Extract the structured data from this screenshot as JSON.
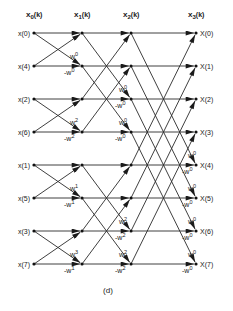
{
  "figure_label": "(d)",
  "columns": [
    {
      "label": "x",
      "sub": "0",
      "arg": "(k)",
      "x": 34
    },
    {
      "label": "x",
      "sub": "1",
      "arg": "(k)",
      "x": 82
    },
    {
      "label": "x",
      "sub": "2",
      "arg": "(k)",
      "x": 131
    },
    {
      "label": "x",
      "sub": "3",
      "arg": "(k)",
      "x": 196
    }
  ],
  "rows_y": [
    33,
    66,
    99,
    132,
    165,
    198,
    231,
    264
  ],
  "inputs": [
    "x(0)",
    "x(4)",
    "x(2)",
    "x(6)",
    "x(1)",
    "x(5)",
    "x(3)",
    "x(7)"
  ],
  "outputs": [
    "X(0)",
    "X(1)",
    "X(2)",
    "X(3)",
    "X(4)",
    "X(5)",
    "X(6)",
    "X(7)"
  ],
  "stages": [
    {
      "from_col": 0,
      "to_col": 1,
      "span": 1,
      "weights": [
        {
          "pair": [
            0,
            1
          ],
          "cross": "w0",
          "bottom": "-w0"
        },
        {
          "pair": [
            2,
            3
          ],
          "cross": "w2",
          "bottom": "-w2"
        },
        {
          "pair": [
            4,
            5
          ],
          "cross": "w1",
          "bottom": "-w1"
        },
        {
          "pair": [
            6,
            7
          ],
          "cross": "w3",
          "bottom": "-w1"
        }
      ]
    },
    {
      "from_col": 1,
      "to_col": 2,
      "span": 2,
      "weights": [
        {
          "row": 2,
          "cross": "w0",
          "bottom": "-w0"
        },
        {
          "row": 3,
          "cross": "w0",
          "bottom": "-w0"
        },
        {
          "row": 6,
          "cross": "w2",
          "bottom": "-w2"
        },
        {
          "row": 7,
          "cross": "w2",
          "bottom": "-w2"
        }
      ]
    },
    {
      "from_col": 2,
      "to_col": 3,
      "span": 4,
      "weights": [
        {
          "row": 4,
          "cross": "w0",
          "bottom": "-w0"
        },
        {
          "row": 5,
          "cross": "w0",
          "bottom": "-w0"
        },
        {
          "row": 6,
          "cross": "w0",
          "bottom": "-w0"
        },
        {
          "row": 7,
          "cross": "w0",
          "bottom": "-w0"
        }
      ]
    }
  ],
  "colors": {
    "line": "#2a2a2a",
    "text": "#222222",
    "background": "#ffffff"
  }
}
